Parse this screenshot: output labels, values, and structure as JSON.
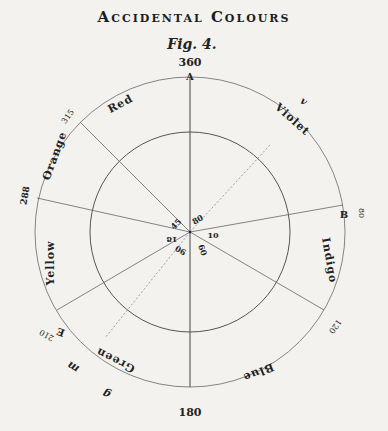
{
  "title": "Accidental Colours",
  "figure_label": "Fig. 4.",
  "diagram": {
    "outer_circle_labels": {
      "top": "360",
      "bottom": "180",
      "deg_315": "315",
      "deg_288": "288",
      "deg_80": "80",
      "deg_120": "120",
      "deg_210": "210"
    },
    "points": {
      "A": "A",
      "B": "B",
      "E": "E",
      "v": "v",
      "m": "m",
      "g": "g"
    },
    "colours": {
      "red": "Red",
      "violet": "Violet",
      "indigo": "Indigo",
      "blue": "Blue",
      "green": "Green",
      "yellow": "Yellow",
      "orange": "Orange"
    },
    "center_numbers": {
      "n45": "45",
      "n80": "80",
      "n18": "18",
      "n10": "10",
      "n90": "90",
      "n60": "60"
    }
  }
}
